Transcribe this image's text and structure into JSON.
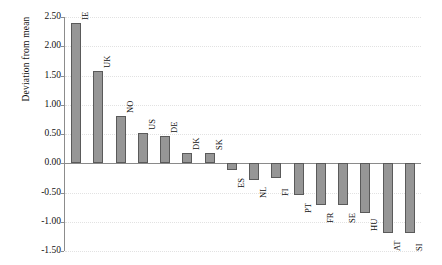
{
  "chart_data": {
    "type": "bar",
    "title": "",
    "xlabel": "",
    "ylabel": "Deviation from mean",
    "ylim": [
      -1.5,
      2.5
    ],
    "ytick_labels": [
      "2.50",
      "2.00",
      "1.50",
      "1.00",
      "0.50",
      "0.00",
      "-0.50",
      "-1.00",
      "-1.50"
    ],
    "ytick_values": [
      2.5,
      2.0,
      1.5,
      1.0,
      0.5,
      0.0,
      -0.5,
      -1.0,
      -1.5
    ],
    "grid": true,
    "legend": "none",
    "bar_color": "#969696",
    "bar_edge_color": "#5a5a5a",
    "categories": [
      "IE",
      "UK",
      "NO",
      "US",
      "DE",
      "DK",
      "SK",
      "ES",
      "NL",
      "FI",
      "PT",
      "FR",
      "SE",
      "HU",
      "AT",
      "SI"
    ],
    "values": [
      2.4,
      1.58,
      0.8,
      0.52,
      0.46,
      0.17,
      0.17,
      -0.12,
      -0.28,
      -0.25,
      -0.55,
      -0.72,
      -0.72,
      -0.85,
      -1.2,
      -1.2
    ]
  }
}
